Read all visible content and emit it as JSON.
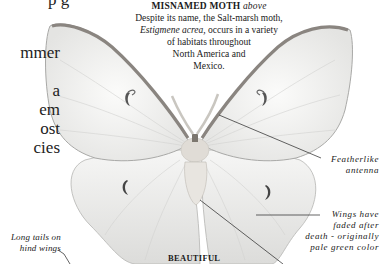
{
  "body_text": {
    "top_fragment": "p  g",
    "lines": [
      "mmer",
      "",
      "a",
      "em",
      "ost",
      "cies"
    ]
  },
  "caption": {
    "title": "MISNAMED MOTH",
    "title_suffix": "above",
    "line1": "Despite its name, the Salt-marsh  moth,",
    "species": "Estigmene acrea,",
    "line2_rest": " occurs in a variety",
    "line3": "of habitats throughout",
    "line4": "North America and",
    "line5": "Mexico."
  },
  "labels": {
    "antenna": [
      "Featherlike",
      "antenna"
    ],
    "wings": [
      "Wings  have",
      "faded  after",
      "death  -  originally",
      "pale green color"
    ],
    "tails": [
      "Long tails on",
      "hind wings"
    ]
  },
  "heading_bottom": "BEAUTIFUL"
}
